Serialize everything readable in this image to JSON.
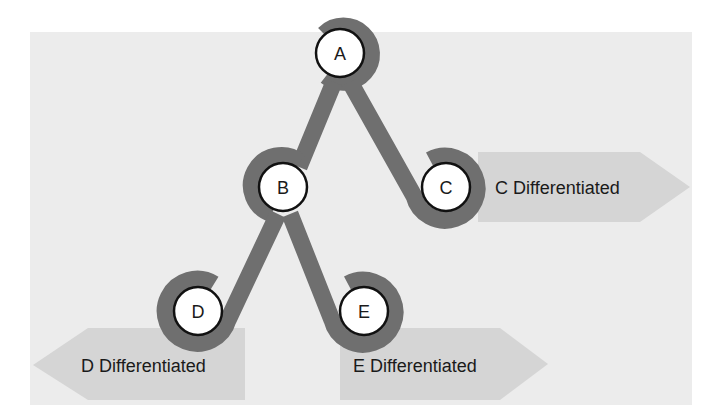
{
  "diagram": {
    "colors": {
      "panel": "#ececec",
      "arrow": "#d5d5d5",
      "path": "#6f6f6f",
      "node_fill": "#ffffff",
      "node_stroke": "#111111",
      "text": "#1a1a1a"
    },
    "nodes": [
      {
        "id": "A",
        "label": "A",
        "x": 340,
        "y": 53
      },
      {
        "id": "B",
        "label": "B",
        "x": 283,
        "y": 187
      },
      {
        "id": "C",
        "label": "C",
        "x": 446,
        "y": 187
      },
      {
        "id": "D",
        "label": "D",
        "x": 198,
        "y": 311
      },
      {
        "id": "E",
        "label": "E",
        "x": 364,
        "y": 311
      }
    ],
    "edges": [
      {
        "from": "A",
        "to": "B"
      },
      {
        "from": "A",
        "to": "C"
      },
      {
        "from": "B",
        "to": "D"
      },
      {
        "from": "B",
        "to": "E"
      }
    ],
    "outcomes": [
      {
        "node": "C",
        "label": "C Differentiated",
        "direction": "right"
      },
      {
        "node": "D",
        "label": "D Differentiated",
        "direction": "left"
      },
      {
        "node": "E",
        "label": "E Differentiated",
        "direction": "right"
      }
    ]
  }
}
